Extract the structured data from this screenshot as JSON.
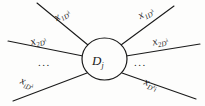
{
  "figure": {
    "name": "factor-graph-node-diagram",
    "background_color": "#fdfdfc",
    "stroke_color": "#1a1a1a",
    "center_node": {
      "label_var": "D",
      "label_sub": "j",
      "cx": 104.5,
      "cy": 59,
      "rx": 22.5,
      "ry": 21
    },
    "ellipsis": {
      "left": "...",
      "right": "..."
    },
    "edges": [
      {
        "id": "edge-top-left",
        "var": "x",
        "sub": "1D",
        "sup": "λ",
        "x1": 37,
        "y1": 3,
        "x2": 88,
        "y2": 45
      },
      {
        "id": "edge-middle-left",
        "var": "x",
        "sub": "2D",
        "sup": "λ",
        "x1": 8,
        "y1": 41,
        "x2": 83,
        "y2": 56
      },
      {
        "id": "edge-bottom-left",
        "var": "x",
        "sub": "iD",
        "sup": "λ",
        "x1": 13,
        "y1": 101,
        "x2": 87,
        "y2": 73
      },
      {
        "id": "edge-top-right",
        "var": "x",
        "sub": "1D",
        "sup": "λ",
        "x1": 121,
        "y1": 45,
        "x2": 174,
        "y2": 6
      },
      {
        "id": "edge-middle-right",
        "var": "x",
        "sub": "2D",
        "sup": "λ",
        "x1": 126,
        "y1": 56,
        "x2": 200,
        "y2": 44
      },
      {
        "id": "edge-bottom-right",
        "var": "x",
        "sub": "D",
        "sup": "λ",
        "sub_after": "i",
        "x1": 122,
        "y1": 73,
        "x2": 196,
        "y2": 99
      }
    ]
  }
}
